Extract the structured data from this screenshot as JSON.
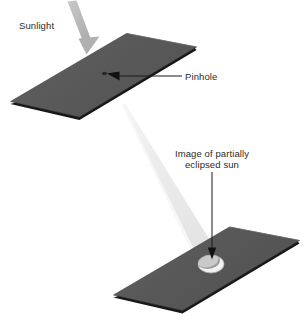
{
  "diagram": {
    "background_color": "#ffffff",
    "labels": {
      "sunlight": "Sunlight",
      "pinhole": "Pinhole",
      "eclipsed_sun_line1": "Image of partially",
      "eclipsed_sun_line2": "eclipsed sun"
    },
    "colors": {
      "board_face": "#59595a",
      "board_face_light": "#6b6b6c",
      "board_edge": "#1c1c1c",
      "sunbeam": "#e8e8e8",
      "sunlight_arrow": "#b4b4b4",
      "leader_line": "#1a1a1a",
      "text": "#2b2b2b",
      "image_spot": "#f2f2f2",
      "image_spot_shadow": "#8f8f90"
    },
    "elements": {
      "upper_board": "flat rectangular card with a pinhole, shown in perspective",
      "lower_board": "flat rectangular screen card catching the projected image",
      "sunbeam": "narrow cone of light from the pinhole down to the screen",
      "sunlight_arrow": "thick gray arrow indicating incoming sunlight",
      "pinhole_marker": "small dark dot on the upper board",
      "projected_image": "crescent-shaped bright spot on the lower board"
    }
  }
}
